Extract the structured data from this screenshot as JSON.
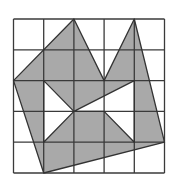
{
  "figure": {
    "type": "grid-shaded-polygon",
    "grid": {
      "cols": 5,
      "rows": 5,
      "origin_px": [
        13.5,
        19
      ],
      "cell_w_px": 30.2,
      "cell_h_px": 30.8,
      "line_color": "#3a3a3a",
      "background": "#ffffff"
    },
    "shading": {
      "fill_color": "#a9a9a9",
      "edge_color": "#333333"
    },
    "outer_polygon": [
      [
        0,
        2
      ],
      [
        2,
        0
      ],
      [
        3,
        2
      ],
      [
        4,
        0
      ],
      [
        5,
        4
      ],
      [
        1,
        5
      ]
    ],
    "holes": [
      [
        [
          1,
          2
        ],
        [
          2,
          3
        ],
        [
          1,
          4
        ]
      ],
      [
        [
          2,
          3
        ],
        [
          4,
          2
        ],
        [
          4,
          4
        ],
        [
          3,
          3
        ]
      ]
    ]
  }
}
